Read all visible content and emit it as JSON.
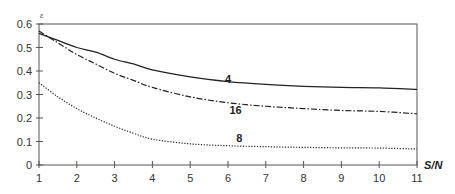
{
  "chart_data": {
    "type": "line",
    "title": "",
    "xlabel": "S/N",
    "ylabel": "ε",
    "xlim": [
      1,
      11
    ],
    "ylim": [
      0,
      0.6
    ],
    "grid": false,
    "legend": "inline curve labels",
    "x_ticks": [
      1,
      2,
      3,
      4,
      5,
      6,
      7,
      8,
      9,
      10,
      11
    ],
    "y_ticks": [
      "0",
      "0.1",
      "0.2",
      "0.3",
      "0.4",
      "0.5",
      "0.6"
    ],
    "x": [
      1,
      1.5,
      2,
      2.5,
      3,
      3.5,
      4,
      5,
      6,
      7,
      8,
      9,
      10,
      11
    ],
    "series": [
      {
        "name": "4",
        "style": "solid",
        "values": [
          0.56,
          0.53,
          0.5,
          0.48,
          0.45,
          0.43,
          0.405,
          0.375,
          0.355,
          0.343,
          0.335,
          0.33,
          0.328,
          0.322
        ]
      },
      {
        "name": "16",
        "style": "dash-dot",
        "values": [
          0.57,
          0.52,
          0.47,
          0.43,
          0.39,
          0.36,
          0.33,
          0.29,
          0.265,
          0.25,
          0.24,
          0.232,
          0.228,
          0.218
        ]
      },
      {
        "name": "8",
        "style": "dotted",
        "values": [
          0.35,
          0.29,
          0.24,
          0.2,
          0.165,
          0.135,
          0.11,
          0.09,
          0.082,
          0.078,
          0.075,
          0.073,
          0.072,
          0.068
        ]
      }
    ],
    "annotations": [
      {
        "text": "4",
        "x": 6.0,
        "y": 0.365
      },
      {
        "text": "16",
        "x": 6.2,
        "y": 0.235
      },
      {
        "text": "8",
        "x": 6.3,
        "y": 0.115
      }
    ]
  },
  "labels": {
    "x_axis_title": "S/N",
    "y_axis_title": "ε",
    "curve_4": "4",
    "curve_16": "16",
    "curve_8": "8"
  }
}
